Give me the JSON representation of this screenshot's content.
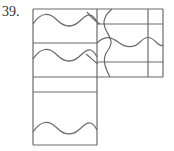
{
  "problem": {
    "number_label": "39."
  },
  "diagram": {
    "stroke_color": "#6a6a6a",
    "background_color": "#ffffff",
    "faces": [
      {
        "id": "left-top",
        "has_wave": true,
        "wave_orientation": "horizontal"
      },
      {
        "id": "left-middle",
        "has_wave": true,
        "wave_orientation": "horizontal"
      },
      {
        "id": "left-thin-strip",
        "has_wave": false
      },
      {
        "id": "left-bottom",
        "has_wave": true,
        "wave_orientation": "horizontal"
      },
      {
        "id": "right-top-strip",
        "has_wave": true,
        "wave_orientation": "vertical"
      },
      {
        "id": "right-center",
        "has_wave": true,
        "wave_orientation": "horizontal-and-vertical"
      },
      {
        "id": "right-bottom-strip",
        "has_wave": true,
        "wave_orientation": "vertical"
      },
      {
        "id": "right-edge-column",
        "has_wave": false
      }
    ]
  }
}
